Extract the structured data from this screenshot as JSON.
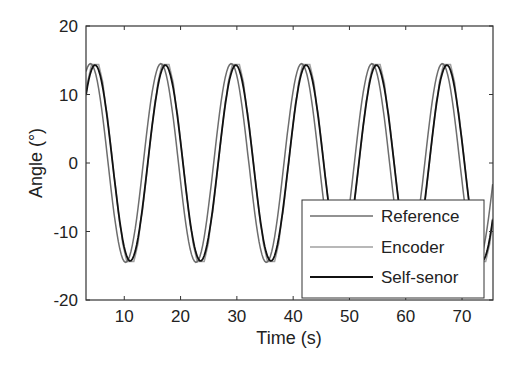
{
  "chart_data": {
    "type": "line",
    "title": "",
    "xlabel": "Time (s)",
    "ylabel": "Angle (°)",
    "xlim": [
      3.2,
      75.5
    ],
    "ylim": [
      -20,
      20
    ],
    "xticks": [
      10,
      20,
      30,
      40,
      50,
      60,
      70
    ],
    "yticks": [
      -20,
      -10,
      0,
      10,
      20
    ],
    "xtick_labels": [
      "10",
      "20",
      "30",
      "40",
      "50",
      "60",
      "70"
    ],
    "ytick_labels": [
      "-20",
      "-10",
      "0",
      "10",
      "20"
    ],
    "grid": false,
    "legend_position": "lower right",
    "series": [
      {
        "name": "Reference",
        "color": "#6e6e6e",
        "amplitude": 14.5,
        "period": 12.5,
        "peak_times": [
          4.0,
          16.5,
          29.0,
          41.5,
          54.0,
          66.5
        ],
        "x": [
          3.2,
          4,
          7,
          10,
          13,
          16.5,
          20,
          23,
          25.5,
          29,
          32.5,
          35,
          38,
          41.5,
          45,
          47.5,
          50.5,
          54,
          57.5,
          60,
          63,
          66.5,
          70,
          72.5,
          75.5
        ],
        "values": [
          14,
          14.5,
          5,
          -12,
          -13,
          14.5,
          5,
          -12,
          -14.5,
          14.5,
          5,
          -12,
          -14.5,
          14.5,
          5,
          -12,
          -14.5,
          14.5,
          5,
          -12,
          -14.5,
          14.5,
          5,
          -12,
          3
        ]
      },
      {
        "name": "Encoder",
        "color": "#a0a0a0",
        "amplitude": 14.8,
        "period": 12.5,
        "peak_times": [
          4.8,
          17.3,
          29.8,
          42.3,
          54.8,
          67.3
        ],
        "x": [
          3.2,
          4.8,
          11,
          17.3,
          23.5,
          29.8,
          36,
          42.3,
          48.5,
          54.8,
          61,
          67.3,
          73.5,
          75.5
        ],
        "values": [
          11,
          12,
          -15.3,
          15.3,
          -15.3,
          14.8,
          -15.3,
          14.8,
          -15.3,
          14.5,
          -15.3,
          14.5,
          -15.3,
          -8
        ]
      },
      {
        "name": "Self-senor",
        "color": "#111111",
        "amplitude": 14.3,
        "period": 12.5,
        "peak_times": [
          5.3,
          17.3,
          29.8,
          42.3,
          54.8,
          67.3
        ],
        "x": [
          3.2,
          5.3,
          10.5,
          17.3,
          23.2,
          29.8,
          35.5,
          42.3,
          48.3,
          54.8,
          60.8,
          67.3,
          73.2,
          75.5
        ],
        "values": [
          12,
          13.3,
          -13.5,
          14.5,
          -14.5,
          14.5,
          -15,
          14.3,
          -14.5,
          14.3,
          -14.5,
          14,
          -14.5,
          -6
        ]
      }
    ]
  },
  "legend": {
    "items": [
      "Reference",
      "Encoder",
      "Self-senor"
    ]
  },
  "axes": {
    "xlabel": "Time (s)",
    "ylabel": "Angle (°)"
  }
}
